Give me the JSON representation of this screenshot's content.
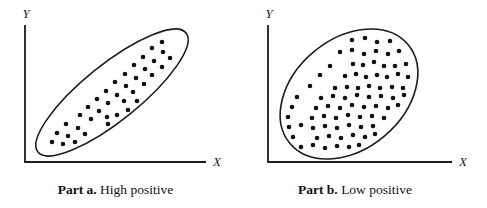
{
  "figure": {
    "background": "#ffffff",
    "ink": "#1c1c1c",
    "dot_color": "#111111"
  },
  "panels": [
    {
      "id": "part-a",
      "caption": {
        "bold": "Part a.",
        "text": " High positive"
      },
      "x_label": "X",
      "y_label": "Y"
    },
    {
      "id": "part-b",
      "caption": {
        "bold": "Part b.",
        "text": " Low positive"
      },
      "x_label": "X",
      "y_label": "Y"
    }
  ],
  "chart_data": [
    {
      "type": "scatter",
      "panel": "part-a",
      "title": "Part a. High positive",
      "xlabel": "X",
      "ylabel": "Y",
      "correlation_depicted": "high positive",
      "axis_ticks": "none",
      "axes": {
        "origin_px": [
          25,
          162
        ],
        "x_end_px": 206,
        "y_top_px": 25,
        "x_label_pos_px": [
          217,
          166
        ],
        "y_label_pos_px": [
          26,
          18
        ]
      },
      "envelope_ellipse_px": {
        "cx": 112,
        "cy": 92.5,
        "rx": 95,
        "ry": 28,
        "rotation_deg": -38.8
      },
      "point_radius_px": 2.3,
      "points_px": [
        [
          52,
          142
        ],
        [
          63,
          144
        ],
        [
          57,
          133
        ],
        [
          68,
          136
        ],
        [
          75,
          142
        ],
        [
          66,
          124
        ],
        [
          78,
          128
        ],
        [
          85,
          134
        ],
        [
          80,
          115
        ],
        [
          91,
          119
        ],
        [
          88,
          107
        ],
        [
          99,
          111
        ],
        [
          107,
          117
        ],
        [
          108,
          124
        ],
        [
          97,
          99
        ],
        [
          108,
          103
        ],
        [
          117,
          115
        ],
        [
          106,
          91
        ],
        [
          117,
          95
        ],
        [
          124,
          101
        ],
        [
          128,
          110
        ],
        [
          115,
          82
        ],
        [
          126,
          86
        ],
        [
          133,
          92
        ],
        [
          137,
          101
        ],
        [
          125,
          74
        ],
        [
          136,
          78
        ],
        [
          144,
          84
        ],
        [
          134,
          65
        ],
        [
          145,
          69
        ],
        [
          152,
          75
        ],
        [
          143,
          57
        ],
        [
          154,
          61
        ],
        [
          162,
          67
        ],
        [
          152,
          48
        ],
        [
          163,
          52
        ],
        [
          170,
          58
        ],
        [
          162,
          42
        ]
      ]
    },
    {
      "type": "scatter",
      "panel": "part-b",
      "title": "Part b. Low positive",
      "xlabel": "X",
      "ylabel": "Y",
      "correlation_depicted": "low positive",
      "axis_ticks": "none",
      "axes": {
        "origin_px": [
          268,
          162
        ],
        "x_end_px": 452,
        "y_top_px": 25,
        "x_label_pos_px": [
          463,
          166
        ],
        "y_label_pos_px": [
          269,
          18
        ]
      },
      "envelope_ellipse_px": {
        "cx": 349,
        "cy": 94,
        "rx": 77,
        "ry": 55,
        "rotation_deg": -40
      },
      "point_radius_px": 2.3,
      "points_px": [
        [
          352,
          40
        ],
        [
          365,
          38
        ],
        [
          377,
          42
        ],
        [
          390,
          41
        ],
        [
          340,
          52
        ],
        [
          352,
          50
        ],
        [
          364,
          54
        ],
        [
          376,
          51
        ],
        [
          388,
          54
        ],
        [
          399,
          51
        ],
        [
          330,
          66
        ],
        [
          353,
          64
        ],
        [
          363,
          65
        ],
        [
          374,
          62
        ],
        [
          384,
          66
        ],
        [
          395,
          66
        ],
        [
          406,
          64
        ],
        [
          320,
          75
        ],
        [
          345,
          76
        ],
        [
          356,
          74
        ],
        [
          366,
          77
        ],
        [
          377,
          75
        ],
        [
          387,
          77
        ],
        [
          398,
          74
        ],
        [
          408,
          77
        ],
        [
          310,
          86
        ],
        [
          335,
          88
        ],
        [
          347,
          87
        ],
        [
          358,
          88
        ],
        [
          369,
          86
        ],
        [
          380,
          88
        ],
        [
          392,
          87
        ],
        [
          403,
          88
        ],
        [
          297,
          97
        ],
        [
          321,
          98
        ],
        [
          333,
          96
        ],
        [
          345,
          98
        ],
        [
          357,
          95
        ],
        [
          369,
          97
        ],
        [
          381,
          96
        ],
        [
          393,
          98
        ],
        [
          404,
          95
        ],
        [
          292,
          107
        ],
        [
          316,
          108
        ],
        [
          328,
          106
        ],
        [
          340,
          108
        ],
        [
          352,
          105
        ],
        [
          364,
          107
        ],
        [
          376,
          106
        ],
        [
          388,
          108
        ],
        [
          398,
          105
        ],
        [
          288,
          117
        ],
        [
          312,
          118
        ],
        [
          324,
          116
        ],
        [
          336,
          118
        ],
        [
          348,
          115
        ],
        [
          360,
          117
        ],
        [
          372,
          116
        ],
        [
          384,
          118
        ],
        [
          289,
          127
        ],
        [
          301,
          125
        ],
        [
          313,
          128
        ],
        [
          325,
          126
        ],
        [
          337,
          128
        ],
        [
          349,
          125
        ],
        [
          361,
          127
        ],
        [
          373,
          126
        ],
        [
          293,
          137
        ],
        [
          317,
          138
        ],
        [
          329,
          136
        ],
        [
          341,
          138
        ],
        [
          353,
          135
        ],
        [
          365,
          137
        ],
        [
          375,
          134
        ],
        [
          301,
          147
        ],
        [
          313,
          145
        ],
        [
          325,
          148
        ],
        [
          337,
          146
        ],
        [
          349,
          147
        ],
        [
          359,
          145
        ]
      ]
    }
  ]
}
